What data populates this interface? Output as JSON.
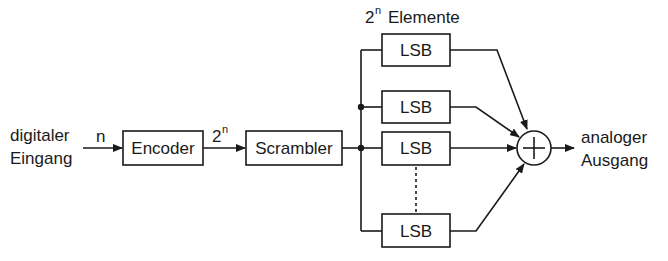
{
  "diagram": {
    "title": {
      "base": "2",
      "exp": "n",
      "text": "Elemente"
    },
    "input_label": [
      "digitaler",
      "Eingang"
    ],
    "output_label": [
      "analoger",
      "Ausgang"
    ],
    "edge_labels": {
      "input_to_encoder": "n",
      "encoder_to_scrambler": {
        "base": "2",
        "exp": "n"
      }
    },
    "blocks": {
      "encoder": "Encoder",
      "scrambler": "Scrambler",
      "lsb": [
        "LSB",
        "LSB",
        "LSB",
        "LSB"
      ]
    },
    "summer": {
      "symbol": "+"
    },
    "colors": {
      "stroke": "#1a1a1a",
      "background": "#ffffff"
    }
  }
}
